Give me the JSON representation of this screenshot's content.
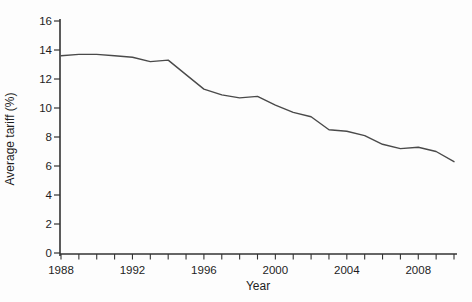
{
  "figure": {
    "background": "#fdfdfd"
  },
  "chart_data": {
    "type": "line",
    "title": "",
    "xlabel": "Year",
    "ylabel": "Average tariff (%)",
    "x": [
      1988,
      1989,
      1990,
      1991,
      1992,
      1993,
      1994,
      1995,
      1996,
      1997,
      1998,
      1999,
      2000,
      2001,
      2002,
      2003,
      2004,
      2005,
      2006,
      2007,
      2008,
      2009,
      2010
    ],
    "series": [
      {
        "name": "Average tariff",
        "values": [
          13.6,
          13.7,
          13.7,
          13.6,
          13.5,
          13.2,
          13.3,
          12.3,
          11.3,
          10.9,
          10.7,
          10.8,
          10.2,
          9.7,
          9.4,
          8.5,
          8.4,
          8.1,
          7.5,
          7.2,
          7.3,
          7.0,
          6.3
        ]
      }
    ],
    "xlim": [
      1988,
      2010
    ],
    "ylim": [
      0,
      16
    ],
    "x_major_ticks": [
      1988,
      1992,
      1996,
      2000,
      2004,
      2008
    ],
    "x_minor_tick_step": 1,
    "y_tick_step": 2,
    "grid": false,
    "legend": "none",
    "line_color": "#4a4a4a",
    "axis_color": "#333333",
    "text_color": "#1d1d1d"
  }
}
